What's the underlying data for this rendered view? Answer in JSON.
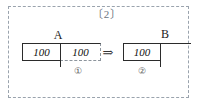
{
  "panel": {
    "caption": "〔2〕",
    "border_color": "#9aa3ad",
    "border_style": "dashed"
  },
  "diagram": {
    "type": "bar-model-transformation",
    "arrow_glyph": "⇒",
    "groups": [
      {
        "id": "A",
        "label": "A",
        "step_marker": "①",
        "cells": [
          {
            "value": "100",
            "border": "solid"
          },
          {
            "value": "100",
            "border": "dashed-right-bottom"
          }
        ]
      },
      {
        "id": "B",
        "label": "B",
        "step_marker": "②",
        "cells": [
          {
            "value": "100",
            "border": "solid"
          }
        ],
        "open_continuation": true
      }
    ],
    "line_color": "#2b2b2b"
  }
}
